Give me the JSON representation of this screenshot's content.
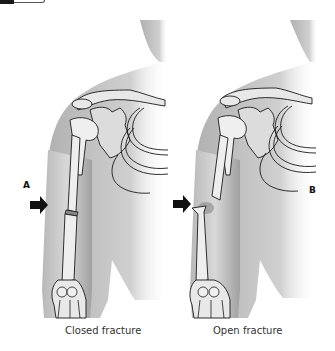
{
  "figure": {
    "panels": [
      {
        "letter": "A",
        "caption": "Closed fracture"
      },
      {
        "letter": "B",
        "caption": "Open fracture"
      }
    ]
  },
  "colors": {
    "skin_light": "#d6d6d6",
    "skin_dark": "#9a9a9a",
    "bone": "#eeeeee",
    "outline": "#1a1a1a",
    "arrow": "#111111"
  }
}
